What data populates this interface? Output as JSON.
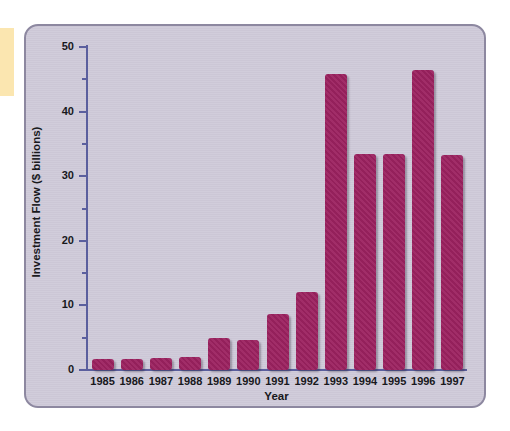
{
  "figure": {
    "panel_bg": "#cfcad9",
    "panel_border": "#8d88a0",
    "axis_color": "#5b5f9e",
    "bar_color": "#9c2260",
    "marker_strip_color": "#fbe6b0"
  },
  "chart_data": {
    "type": "bar",
    "title": "",
    "xlabel": "Year",
    "ylabel": "Investment Flow ($ billions)",
    "categories": [
      "1985",
      "1986",
      "1987",
      "1988",
      "1989",
      "1990",
      "1991",
      "1992",
      "1993",
      "1994",
      "1995",
      "1996",
      "1997"
    ],
    "values": [
      1.7,
      1.7,
      1.9,
      2.0,
      5.0,
      4.7,
      8.6,
      12.0,
      45.8,
      33.5,
      33.5,
      46.5,
      33.3
    ],
    "ylim": [
      0,
      50
    ],
    "ytick_labels": [
      "0",
      "10",
      "20",
      "30",
      "40",
      "50"
    ],
    "ytick_values": [
      0,
      10,
      20,
      30,
      40,
      50
    ],
    "yminor_tick_values": [
      5,
      15,
      25,
      35,
      45
    ],
    "grid": false,
    "legend": null
  }
}
